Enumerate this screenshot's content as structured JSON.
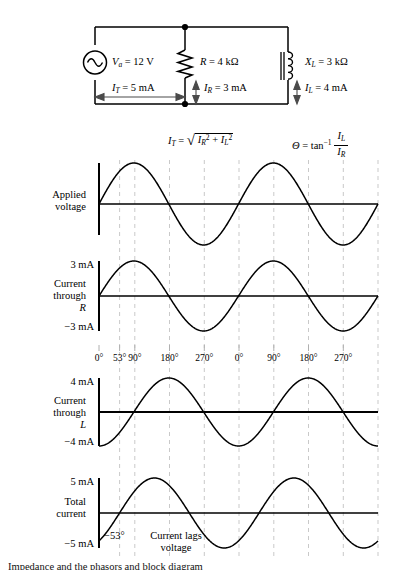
{
  "figure": {
    "caption_fragment": "Impedance and the phasors and block diagram"
  },
  "circuit": {
    "source": {
      "symbol": "ac-source-icon",
      "label_var": "V",
      "label_sub": "a",
      "label_value": "= 12 V"
    },
    "resistor": {
      "symbol": "resistor-icon",
      "label_var": "R",
      "label_value": "= 4 kΩ"
    },
    "inductor": {
      "symbol": "inductor-icon",
      "label_var": "X",
      "label_sub": "L",
      "label_value": "= 3 kΩ"
    },
    "currents": [
      {
        "name": "total",
        "var": "I",
        "sub": "T",
        "value": "= 5 mA",
        "arrow": "double-arrow-horizontal-icon"
      },
      {
        "name": "resistor",
        "var": "I",
        "sub": "R",
        "value": "= 3 mA",
        "arrow": "double-arrow-vertical-icon"
      },
      {
        "name": "inductor",
        "var": "I",
        "sub": "L",
        "value": "= 4 mA",
        "arrow": "double-arrow-vertical-icon"
      }
    ]
  },
  "formulas": {
    "total_current": {
      "lhs_var": "I",
      "lhs_sub": "T",
      "eq": "=",
      "radical": "√",
      "term1_var": "I",
      "term1_sub": "R",
      "term1_sup": "2",
      "plus": "+",
      "term2_var": "I",
      "term2_sub": "L",
      "term2_sup": "2"
    },
    "phase_angle": {
      "lhs": "Θ",
      "eq": "=",
      "fn": "tan",
      "fn_sup": "−1",
      "num_var": "I",
      "num_sub": "L",
      "den_var": "I",
      "den_sub": "R"
    }
  },
  "axis": {
    "ticks": [
      "0°",
      "53°",
      "90°",
      "180°",
      "270°",
      "0°",
      "90°",
      "180°",
      "270°"
    ],
    "tick_degrees": [
      0,
      53,
      90,
      180,
      270,
      360,
      450,
      540,
      630
    ]
  },
  "panels": [
    {
      "name": "applied-voltage",
      "label_lines": [
        "Applied",
        "voltage"
      ],
      "ymax_label": "",
      "ymin_label": "",
      "phase_deg": 0,
      "amplitude": 1.0
    },
    {
      "name": "current-through-r",
      "label_lines": [
        "Current",
        "through",
        "R"
      ],
      "label_italic_line": 2,
      "ymax_label": "3 mA",
      "ymin_label": "−3 mA",
      "phase_deg": 0,
      "amplitude": 3
    },
    {
      "name": "current-through-l",
      "label_lines": [
        "Current",
        "through",
        "L"
      ],
      "label_italic_line": 2,
      "ymax_label": "4 mA",
      "ymin_label": "−4 mA",
      "phase_deg": -90,
      "amplitude": 4
    },
    {
      "name": "total-current",
      "label_lines": [
        "Total",
        "current"
      ],
      "ymax_label": "5 mA",
      "ymin_label": "−5 mA",
      "phase_deg": -53,
      "amplitude": 5,
      "annotation_angle": "−53°",
      "annotation_lines": [
        "Current lags",
        "voltage"
      ]
    }
  ],
  "chart_data": {
    "type": "line",
    "xlabel": "Phase angle (degrees)",
    "ylabel": "Amplitude",
    "xlim": [
      0,
      720
    ],
    "xticks": [
      0,
      53,
      90,
      180,
      270,
      360,
      450,
      540,
      630
    ],
    "xticklabels": [
      "0°",
      "53°",
      "90°",
      "180°",
      "270°",
      "0°",
      "90°",
      "180°",
      "270°"
    ],
    "grid": true,
    "legend": "none",
    "series": [
      {
        "name": "Applied voltage",
        "waveform": "sine",
        "amplitude": 12,
        "unit": "V",
        "phase_deg": 0,
        "cycles": 2,
        "ylim": [
          -12,
          12
        ],
        "ytick_labels": []
      },
      {
        "name": "Current through R",
        "waveform": "sine",
        "amplitude": 3,
        "unit": "mA",
        "phase_deg": 0,
        "cycles": 2,
        "ylim": [
          -3,
          3
        ],
        "ytick_labels": [
          "3 mA",
          "−3 mA"
        ]
      },
      {
        "name": "Current through L",
        "waveform": "sine",
        "amplitude": 4,
        "unit": "mA",
        "phase_deg": -90,
        "cycles": 2,
        "ylim": [
          -4,
          4
        ],
        "ytick_labels": [
          "4 mA",
          "−4 mA"
        ]
      },
      {
        "name": "Total current",
        "waveform": "sine",
        "amplitude": 5,
        "unit": "mA",
        "phase_deg": -53,
        "cycles": 2,
        "ylim": [
          -5,
          5
        ],
        "ytick_labels": [
          "5 mA",
          "−5 mA"
        ]
      }
    ],
    "annotations": [
      {
        "text": "−53°",
        "series": "Total current",
        "x_deg": 26
      },
      {
        "text": "Current lags voltage",
        "series": "Total current",
        "x_deg": 120
      }
    ]
  }
}
